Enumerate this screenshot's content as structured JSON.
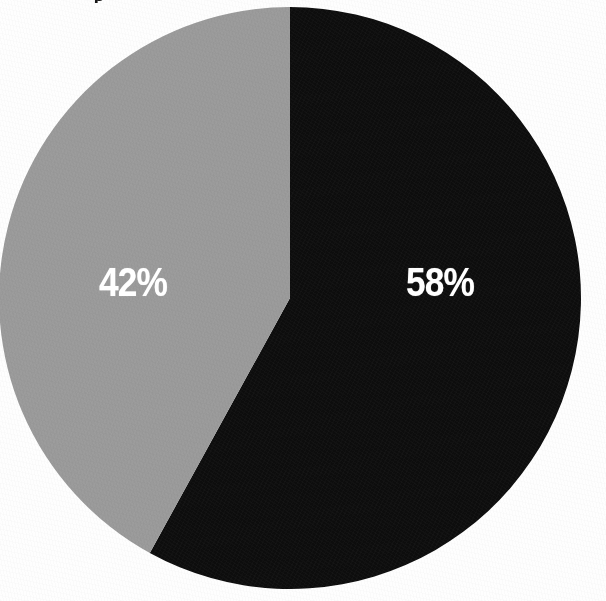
{
  "figure": {
    "background_color": "#fefefe",
    "width": 606,
    "height": 601,
    "caption_fragment": "p",
    "note": "scanned two-slice pie chart, grainy halftone texture"
  },
  "chart_data": {
    "type": "pie",
    "title": "",
    "subtitle": "",
    "xlabel": "",
    "ylabel": "",
    "grid": false,
    "legend_position": "none",
    "labels_on_slices": true,
    "label_format": "percent",
    "start_angle_deg": 0,
    "direction": "clockwise",
    "center": [
      290,
      298
    ],
    "radius": 291,
    "categories": [
      "Black segment",
      "Gray segment"
    ],
    "values": [
      58,
      42
    ],
    "slices": [
      {
        "label": "58%",
        "value": 58,
        "color": "#0d0d0d",
        "start_angle_deg": 0,
        "sweep_angle_deg": 208.8,
        "label_color": "#ffffff",
        "label_x": 440,
        "label_y": 283
      },
      {
        "label": "42%",
        "value": 42,
        "color": "#9a9a9a",
        "start_angle_deg": 208.8,
        "sweep_angle_deg": 151.2,
        "label_color": "#ffffff",
        "label_x": 133,
        "label_y": 283
      }
    ],
    "annotations": []
  },
  "colors": {
    "slice_dark": "#0d0d0d",
    "slice_gray": "#9a9a9a",
    "label_text": "#ffffff",
    "page_background": "#fefefe"
  }
}
